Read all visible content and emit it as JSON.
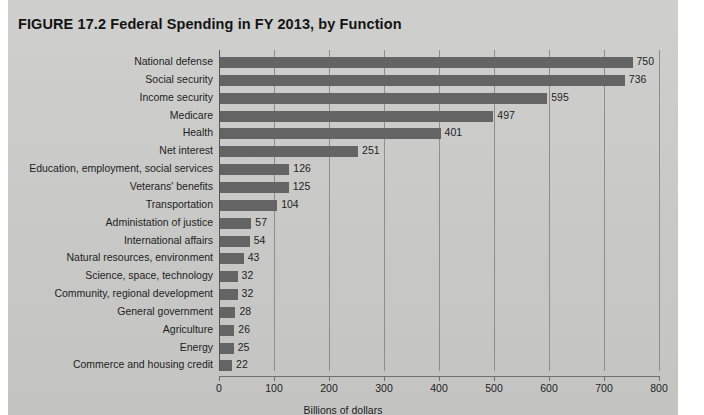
{
  "figure": {
    "title": "FIGURE 17.2  Federal Spending in FY 2013, by Function"
  },
  "colors": {
    "panel_background": "#c9cac8",
    "bar": "#636463",
    "gridline": "#8d8e8c",
    "axis": "#6f706e",
    "text": "#1d1d1d",
    "page_background": "#ffffff"
  },
  "chart_data": {
    "type": "bar",
    "orientation": "horizontal",
    "title": "FIGURE 17.2  Federal Spending in FY 2013, by Function",
    "xlabel": "Billions of dollars",
    "ylabel": "",
    "xlim": [
      0,
      800
    ],
    "xticks": [
      0,
      100,
      200,
      300,
      400,
      500,
      600,
      700,
      800
    ],
    "xtick_labels": [
      "0",
      "100",
      "200",
      "300",
      "400",
      "500",
      "600",
      "700",
      "800"
    ],
    "grid": true,
    "grid_axis": "x",
    "legend": false,
    "data_labels": true,
    "categories": [
      "National defense",
      "Social security",
      "Income security",
      "Medicare",
      "Health",
      "Net interest",
      "Education, employment, social services",
      "Veterans' benefits",
      "Transportation",
      "Administation of justice",
      "International affairs",
      "Natural resources, environment",
      "Science, space, technology",
      "Community, regional development",
      "General government",
      "Agriculture",
      "Energy",
      "Commerce and housing credit"
    ],
    "values": [
      750,
      736,
      595,
      497,
      401,
      251,
      126,
      125,
      104,
      57,
      54,
      43,
      32,
      32,
      28,
      26,
      25,
      22
    ],
    "value_labels": [
      "750",
      "736",
      "595",
      "497",
      "401",
      "251",
      "126",
      "125",
      "104",
      "57",
      "54",
      "43",
      "32",
      "32",
      "28",
      "26",
      "25",
      "22"
    ]
  }
}
